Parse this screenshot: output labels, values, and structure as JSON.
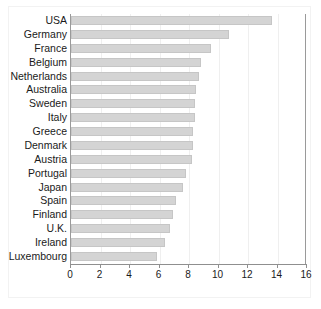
{
  "chart_data": {
    "type": "bar",
    "orientation": "horizontal",
    "title": "",
    "subtitle": "",
    "xlabel": "",
    "ylabel": "",
    "xlim": [
      0,
      16
    ],
    "ylim": null,
    "grid": true,
    "legend": null,
    "legend_position": "none",
    "bar_color": "#d4d4d4",
    "bar_edge_color": "#c6c6c6",
    "axis_color": "#8f8f8f",
    "gridline_color": "#efefef",
    "text_color": "#1a1a1a",
    "xticks": [
      0,
      2,
      4,
      6,
      8,
      10,
      12,
      14,
      16
    ],
    "xtick_labels": [
      "0",
      "2",
      "4",
      "6",
      "8",
      "10",
      "12",
      "14",
      "16"
    ],
    "categories": [
      "USA",
      "Germany",
      "France",
      "Belgium",
      "Netherlands",
      "Australia",
      "Sweden",
      "Italy",
      "Greece",
      "Denmark",
      "Austria",
      "Portugal",
      "Japan",
      "Spain",
      "Finland",
      "U.K.",
      "Ireland",
      "Luxembourg"
    ],
    "values": [
      13.6,
      10.7,
      9.5,
      8.8,
      8.7,
      8.5,
      8.4,
      8.4,
      8.3,
      8.3,
      8.2,
      7.8,
      7.6,
      7.1,
      6.9,
      6.7,
      6.4,
      5.8
    ],
    "series": [
      {
        "name": "",
        "values": [
          13.6,
          10.7,
          9.5,
          8.8,
          8.7,
          8.5,
          8.4,
          8.4,
          8.3,
          8.3,
          8.2,
          7.8,
          7.6,
          7.1,
          6.9,
          6.7,
          6.4,
          5.8
        ]
      }
    ],
    "annotations": []
  }
}
